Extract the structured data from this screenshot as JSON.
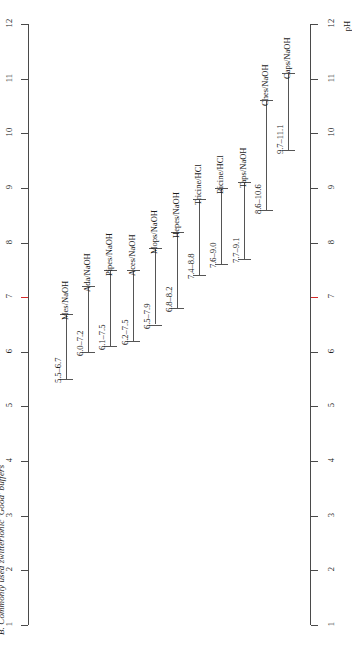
{
  "figure": {
    "caption": "B. Commonly used zwitterionic 'Good' buffers",
    "axis_title": "pH",
    "colors": {
      "line": "#555555",
      "axis": "#4a4a4a",
      "highlight": "#d42a2a",
      "background": "#ffffff"
    }
  },
  "chart_data": {
    "type": "bar",
    "title": "B. Commonly used zwitterionic 'Good' buffers",
    "xlabel": "",
    "ylabel": "pH",
    "orientation": "horizontal-ranges",
    "ylim": [
      1,
      12
    ],
    "grid": false,
    "legend": "none",
    "axis_ticks": [
      1,
      2,
      3,
      4,
      5,
      6,
      7,
      8,
      9,
      10,
      11,
      12
    ],
    "tick_labels": [
      "1",
      "2",
      "3",
      "4",
      "5",
      "6",
      "7",
      "8",
      "9",
      "10",
      "11",
      "12"
    ],
    "highlighted_tick": 7,
    "categories": [
      "Mes/NaOH",
      "Ada/NaOH",
      "Pipes/NaOH",
      "Aces/NaOH",
      "Mops/NaOH",
      "Hepes/NaOH",
      "Tricine/HCl",
      "Bicine/HCl",
      "Taps/NaOH",
      "Ches/NaOH",
      "Caps/NaOH"
    ],
    "ranges": [
      {
        "name": "Mes/NaOH",
        "low": 5.5,
        "high": 6.7,
        "label": "5.5–6.7"
      },
      {
        "name": "Ada/NaOH",
        "low": 6.0,
        "high": 7.2,
        "label": "6.0–7.2"
      },
      {
        "name": "Pipes/NaOH",
        "low": 6.1,
        "high": 7.5,
        "label": "6.1–7.5"
      },
      {
        "name": "Aces/NaOH",
        "low": 6.2,
        "high": 7.5,
        "label": "6.2–7.5"
      },
      {
        "name": "Mops/NaOH",
        "low": 6.5,
        "high": 7.9,
        "label": "6.5–7.9"
      },
      {
        "name": "Hepes/NaOH",
        "low": 6.8,
        "high": 8.2,
        "label": "6.8–8.2"
      },
      {
        "name": "Tricine/HCl",
        "low": 7.4,
        "high": 8.8,
        "label": "7.4–8.8"
      },
      {
        "name": "Bicine/HCl",
        "low": 7.6,
        "high": 9.0,
        "label": "7.6–9.0"
      },
      {
        "name": "Taps/NaOH",
        "low": 7.7,
        "high": 9.1,
        "label": "7.7–9.1"
      },
      {
        "name": "Ches/NaOH",
        "low": 8.6,
        "high": 10.6,
        "label": "8.6–10.6"
      },
      {
        "name": "Caps/NaOH",
        "low": 9.7,
        "high": 11.1,
        "label": "9.7–11.1"
      }
    ]
  }
}
